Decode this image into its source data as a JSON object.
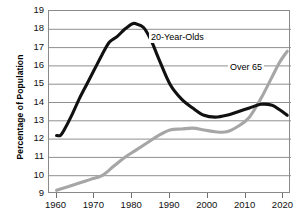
{
  "chart_data": {
    "type": "line",
    "title": "",
    "xlabel": "",
    "ylabel": "Percentage of Population",
    "xlim": [
      1958,
      2022
    ],
    "ylim": [
      9,
      19
    ],
    "grid": true,
    "legend_position": "inline-annotations",
    "xticks": [
      1960,
      1970,
      1980,
      1990,
      2000,
      2010,
      2020
    ],
    "yticks": [
      9,
      10,
      11,
      12,
      13,
      14,
      15,
      16,
      17,
      18,
      19
    ],
    "series": [
      {
        "name": "20-Year-Olds",
        "color": "#111111",
        "x": [
          1960,
          1961,
          1962,
          1964,
          1966,
          1968,
          1970,
          1972,
          1974,
          1976,
          1978,
          1980,
          1981,
          1983,
          1985,
          1987,
          1990,
          1993,
          1996,
          1999,
          2002,
          2005,
          2008,
          2011,
          2014,
          2017,
          2019,
          2021
        ],
        "values": [
          12.2,
          12.2,
          12.5,
          13.3,
          14.2,
          15.0,
          15.8,
          16.6,
          17.3,
          17.6,
          18.0,
          18.3,
          18.3,
          18.1,
          17.4,
          16.4,
          15.0,
          14.2,
          13.7,
          13.3,
          13.2,
          13.3,
          13.5,
          13.7,
          13.9,
          13.85,
          13.6,
          13.3
        ]
      },
      {
        "name": "Over 65",
        "color": "#a6a6a6",
        "x": [
          1960,
          1963,
          1966,
          1969,
          1972,
          1975,
          1978,
          1981,
          1984,
          1987,
          1990,
          1993,
          1996,
          1999,
          2002,
          2005,
          2008,
          2011,
          2014,
          2017,
          2019,
          2021
        ],
        "values": [
          9.2,
          9.4,
          9.6,
          9.8,
          10.0,
          10.5,
          11.0,
          11.4,
          11.8,
          12.2,
          12.5,
          12.55,
          12.6,
          12.5,
          12.4,
          12.4,
          12.7,
          13.2,
          14.2,
          15.4,
          16.2,
          16.8
        ]
      }
    ]
  },
  "axis": {
    "ylabel": "Percentage of Population",
    "yticks": [
      "19",
      "18",
      "17",
      "16",
      "15",
      "14",
      "13",
      "12",
      "11",
      "10",
      "9"
    ],
    "xticks": [
      "1960",
      "1970",
      "1980",
      "1990",
      "2000",
      "2010",
      "2020"
    ]
  },
  "annotations": {
    "young_label": "20-Year-Olds",
    "old_label": "Over 65"
  },
  "colors": {
    "young_series": "#111111",
    "old_series": "#a6a6a6",
    "grid": "#8f8f8f",
    "frame": "#8a8a8a"
  }
}
